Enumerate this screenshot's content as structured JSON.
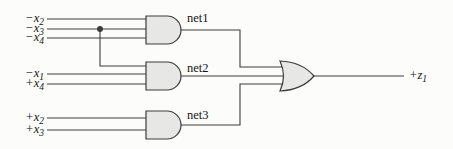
{
  "diagram": {
    "type": "logic-circuit",
    "colors": {
      "background": "#fcfcfb",
      "wire": "#3c3c3c",
      "gate_fill": "#e7e7e5",
      "gate_stroke": "#3c3c3c",
      "text": "#141414"
    },
    "inputs": [
      {
        "base": "−x",
        "sub": "2"
      },
      {
        "base": "−x",
        "sub": "3"
      },
      {
        "base": "−x",
        "sub": "4"
      },
      {
        "base": "−x",
        "sub": "1"
      },
      {
        "base": "+x",
        "sub": "4"
      },
      {
        "base": "+x",
        "sub": "2"
      },
      {
        "base": "+x",
        "sub": "3"
      }
    ],
    "nets": [
      {
        "label": "net1",
        "gate": "AND"
      },
      {
        "label": "net2",
        "gate": "AND"
      },
      {
        "label": "net3",
        "gate": "AND"
      }
    ],
    "output_gate": "OR",
    "output": {
      "base": "+z",
      "sub": "1"
    }
  }
}
